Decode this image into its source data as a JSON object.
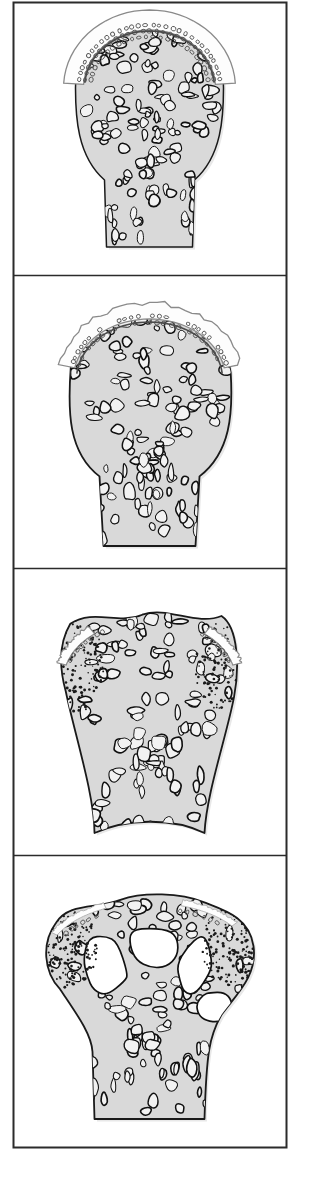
{
  "figure": {
    "title": "Stages of epiphyseal bone maturation",
    "kind": "anatomical-line-illustration",
    "panel_count": 4,
    "background_color": "#ffffff",
    "frame_color": "#2b2b2b",
    "bone_fill_color": "#d9d9d9",
    "cortex_outline_color": "#1a1a1a",
    "trabecula_outline_color": "#111111",
    "cartilage_fill_color": "#fdfdfd",
    "cartilage_outline_color": "#8a8a8a",
    "stipple_color": "#1a1a1a",
    "cavity_fill_color": "#ffffff",
    "frame": {
      "x": 13,
      "y": 2,
      "width": 273,
      "height": 1145,
      "stroke_width": 2
    },
    "dividers_y": [
      275,
      568,
      855
    ]
  },
  "panels": [
    {
      "id": "panel-1",
      "index": 1,
      "name": "immature-epiphysis-with-thick-cartilage-cap",
      "bounds": {
        "x": 13,
        "y": 2,
        "width": 273,
        "height": 273
      },
      "description": "Rounded bone head covered by a thick continuous cartilage cap showing columns of small chondrocyte lacunae; dense fine trabecular network fills the head and tapers into the metaphysis.",
      "cartilage": {
        "present": true,
        "style": "continuous-cap",
        "thickness": 20,
        "chondrocyte_rows": 3
      },
      "stipple_shoulders": false,
      "large_cavities": 0,
      "trabecula_count": 150,
      "trabecula_scale": 1.0,
      "shaft": {
        "top_width": 86,
        "bottom_width": 86
      }
    },
    {
      "id": "panel-2",
      "index": 2,
      "name": "resorbing-irregular-cartilage-cap",
      "bounds": {
        "x": 13,
        "y": 275,
        "width": 273,
        "height": 293
      },
      "description": "Cartilage cap is thinning and breaking up into ragged irregular islands; the subchondral plate is now a distinct dark arc and trabeculae below are coarser.",
      "cartilage": {
        "present": true,
        "style": "ragged-islands",
        "thickness": 16,
        "chondrocyte_rows": 2
      },
      "stipple_shoulders": false,
      "large_cavities": 0,
      "trabecula_count": 135,
      "trabecula_scale": 1.12,
      "shaft": {
        "top_width": 92,
        "bottom_width": 92
      }
    },
    {
      "id": "panel-3",
      "index": 3,
      "name": "flared-metaphysis-with-stippled-margins",
      "bounds": {
        "x": 13,
        "y": 568,
        "width": 273,
        "height": 287
      },
      "description": "Cartilage reduced to two small residual patches at the top margin; lateral shoulders flare outward and are filled with dense stipple marking new periosteal bone; trabeculae are coarse and radiate toward the shaft.",
      "cartilage": {
        "present": true,
        "style": "residual-patches",
        "thickness": 9,
        "chondrocyte_rows": 1
      },
      "stipple_shoulders": true,
      "large_cavities": 0,
      "trabecula_count": 120,
      "trabecula_scale": 1.2,
      "shaft": {
        "top_width": 104,
        "bottom_width": 98
      }
    },
    {
      "id": "panel-4",
      "index": 4,
      "name": "mature-epiphysis-with-marrow-cavities",
      "bounds": {
        "x": 13,
        "y": 855,
        "width": 273,
        "height": 292
      },
      "description": "Broad mushroom-shaped mature end; four large confluent marrow cavities open beneath the articular surface, heavy stipple fills the widely flared shoulders, and only a faint pale strip of articular cartilage remains.",
      "cartilage": {
        "present": true,
        "style": "thin-surface-strip",
        "thickness": 6,
        "chondrocyte_rows": 1
      },
      "stipple_shoulders": true,
      "large_cavities": 4,
      "trabecula_count": 130,
      "trabecula_scale": 1.15,
      "shaft": {
        "top_width": 110,
        "bottom_width": 110
      }
    }
  ]
}
